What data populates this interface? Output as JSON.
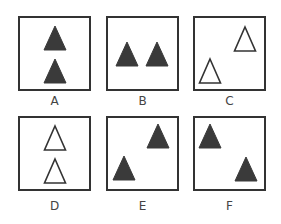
{
  "colors": {
    "border": "#333333",
    "filled": "#3a3a3a",
    "outline_fill": "#ffffff",
    "label": "#444444"
  },
  "panels": [
    {
      "label": "A",
      "box": {
        "x": 18,
        "y": 16
      },
      "triangles": [
        {
          "cx": 37,
          "top": 10,
          "w": 22,
          "h": 24,
          "style": "filled"
        },
        {
          "cx": 37,
          "top": 43,
          "w": 22,
          "h": 24,
          "style": "filled"
        }
      ]
    },
    {
      "label": "B",
      "box": {
        "x": 106,
        "y": 16
      },
      "triangles": [
        {
          "cx": 21,
          "top": 26,
          "w": 22,
          "h": 24,
          "style": "filled"
        },
        {
          "cx": 51,
          "top": 26,
          "w": 22,
          "h": 24,
          "style": "filled"
        }
      ]
    },
    {
      "label": "C",
      "box": {
        "x": 193,
        "y": 16
      },
      "triangles": [
        {
          "cx": 52,
          "top": 11,
          "w": 21,
          "h": 24,
          "style": "outline"
        },
        {
          "cx": 17,
          "top": 43,
          "w": 21,
          "h": 24,
          "style": "outline"
        }
      ]
    },
    {
      "label": "D",
      "box": {
        "x": 18,
        "y": 116
      },
      "triangles": [
        {
          "cx": 37,
          "top": 10,
          "w": 21,
          "h": 24,
          "style": "outline"
        },
        {
          "cx": 37,
          "top": 43,
          "w": 21,
          "h": 24,
          "style": "outline"
        }
      ]
    },
    {
      "label": "E",
      "box": {
        "x": 106,
        "y": 116
      },
      "triangles": [
        {
          "cx": 52,
          "top": 8,
          "w": 22,
          "h": 24,
          "style": "filled"
        },
        {
          "cx": 18,
          "top": 40,
          "w": 22,
          "h": 24,
          "style": "filled"
        }
      ]
    },
    {
      "label": "F",
      "box": {
        "x": 193,
        "y": 116
      },
      "triangles": [
        {
          "cx": 17,
          "top": 8,
          "w": 22,
          "h": 24,
          "style": "filled"
        },
        {
          "cx": 53,
          "top": 41,
          "w": 22,
          "h": 24,
          "style": "filled"
        }
      ]
    }
  ]
}
